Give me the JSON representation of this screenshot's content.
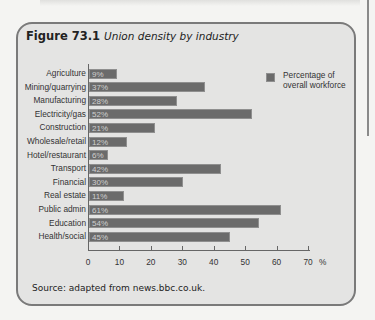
{
  "figure": {
    "number": "Figure 73.1",
    "caption": "Union density by industry",
    "source": "Source: adapted from news.bbc.co.uk."
  },
  "colors": {
    "bar": "#6b6b6b",
    "panel_bg": "#e4e4e3",
    "panel_border": "#7a7a7a"
  },
  "chart_data": {
    "type": "bar",
    "orientation": "horizontal",
    "title": "Union density by industry",
    "xlabel": "%",
    "ylabel": "",
    "xlim": [
      0,
      70
    ],
    "x_ticks": [
      "0",
      "10",
      "20",
      "30",
      "40",
      "50",
      "60",
      "70"
    ],
    "x_unit": "%",
    "grid": false,
    "legend": {
      "position": "upper right",
      "entries": [
        "Percentage of overall workforce"
      ]
    },
    "categories": [
      "Agriculture",
      "Mining/quarrying",
      "Manufacturing",
      "Electricity/gas",
      "Construction",
      "Wholesale/retail",
      "Hotel/restaurant",
      "Transport",
      "Financial",
      "Real estate",
      "Public admin",
      "Education",
      "Health/social"
    ],
    "values": [
      9,
      37,
      28,
      52,
      21,
      12,
      6,
      42,
      30,
      11,
      61,
      54,
      45
    ],
    "value_labels": [
      "9%",
      "37%",
      "28%",
      "52%",
      "21%",
      "12%",
      "6%",
      "42%",
      "30%",
      "11%",
      "61%",
      "54%",
      "45%"
    ],
    "series": [
      {
        "name": "Percentage of overall workforce",
        "values": [
          9,
          37,
          28,
          52,
          21,
          12,
          6,
          42,
          30,
          11,
          61,
          54,
          45
        ]
      }
    ]
  },
  "legend": {
    "label": "Percentage of overall workforce"
  }
}
